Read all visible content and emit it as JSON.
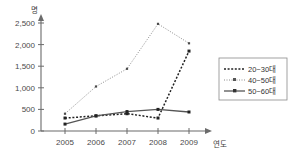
{
  "chart_data": {
    "type": "line",
    "title": "",
    "subtitle": "",
    "xlabel": "연도",
    "ylabel": "명",
    "categories": [
      "2005",
      "2006",
      "2007",
      "2008",
      "2009"
    ],
    "x": [
      2005,
      2006,
      2007,
      2008,
      2009
    ],
    "ylim": [
      0,
      2500
    ],
    "xlim": [
      2005,
      2009
    ],
    "yticks": [
      0,
      500,
      1000,
      1500,
      2000,
      2500
    ],
    "ytick_labels": [
      "0",
      "500",
      "1,000",
      "1,500",
      "2,000",
      "2,500"
    ],
    "xtick_labels": [
      "2005",
      "2006",
      "2007",
      "2008",
      "2009"
    ],
    "grid": false,
    "legend_position": "right",
    "series": [
      {
        "name": "20~30대",
        "values": [
          300,
          350,
          400,
          300,
          1850
        ],
        "line_style": "dotted-square",
        "color": "#222222",
        "marker": "square"
      },
      {
        "name": "40~50대",
        "values": [
          400,
          1030,
          1440,
          2480,
          2030
        ],
        "line_style": "fine-dotted",
        "color": "#8c8c8c",
        "marker": "small-square"
      },
      {
        "name": "50~60대",
        "values": [
          160,
          350,
          450,
          500,
          440
        ],
        "line_style": "solid",
        "color": "#555555",
        "marker": "square"
      }
    ]
  },
  "legend": {
    "items": [
      {
        "label": "20~30대"
      },
      {
        "label": "40~50대"
      },
      {
        "label": "50~60대"
      }
    ]
  },
  "axes": {
    "y_unit_label": "명",
    "x_unit_label": "연도"
  }
}
